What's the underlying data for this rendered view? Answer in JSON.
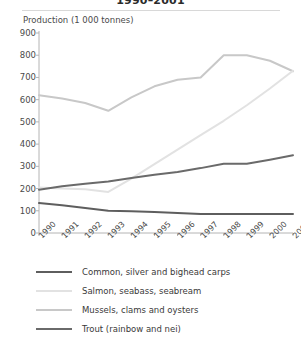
{
  "header": {
    "title": "1990–2001",
    "axis_note": "Production (1 000 tonnes)"
  },
  "chart_data": {
    "type": "line",
    "title": "1990–2001",
    "xlabel": "",
    "ylabel": "Production (1 000 tonnes)",
    "ylim": [
      0,
      900
    ],
    "ytick_step": 100,
    "yticks": [
      "0",
      "100",
      "200",
      "300",
      "400",
      "500",
      "600",
      "700",
      "800",
      "900"
    ],
    "grid": false,
    "legend_position": "bottom",
    "categories": [
      "1990",
      "1991",
      "1992",
      "1993",
      "1994",
      "1995",
      "1996",
      "1997",
      "1998",
      "1999",
      "2000",
      "2001"
    ],
    "series": [
      {
        "name": "Common, silver and bighead carps",
        "color": "#5e5e5e",
        "values": [
          135,
          125,
          113,
          100,
          98,
          95,
          90,
          86,
          85,
          85,
          85,
          85
        ]
      },
      {
        "name": "Salmon, seabass, seabream",
        "color": "#e2e2e2",
        "values": [
          205,
          200,
          197,
          185,
          245,
          310,
          375,
          440,
          505,
          575,
          650,
          730
        ]
      },
      {
        "name": "Mussels, clams and oysters",
        "color": "#c8c8c8",
        "values": [
          620,
          605,
          585,
          550,
          610,
          660,
          690,
          700,
          800,
          800,
          775,
          728
        ]
      },
      {
        "name": "Trout (rainbow and nei)",
        "color": "#6a6a6a",
        "values": [
          195,
          210,
          222,
          232,
          248,
          262,
          275,
          292,
          312,
          312,
          330,
          350
        ]
      }
    ]
  }
}
